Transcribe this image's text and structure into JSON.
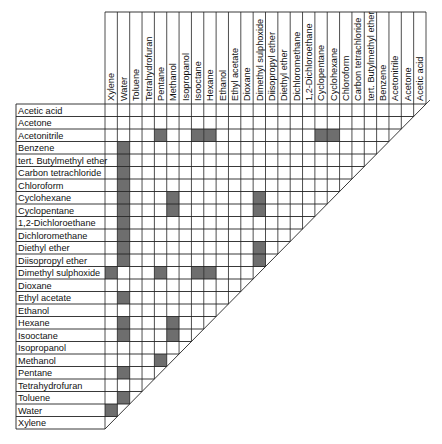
{
  "chart_data": {
    "type": "heatmap",
    "shade_color": "#6e6e6e",
    "grid_color": "#222222",
    "columns": [
      "Xylene",
      "Water",
      "Toluene",
      "Tetrahydrofuran",
      "Pentane",
      "Methanol",
      "Isopropanol",
      "Isooctane",
      "Hexane",
      "Ethanol",
      "Ethyl acetate",
      "Dioxane",
      "Dimethyl sulphoxide",
      "Diisopropyl ether",
      "Diethyl ether",
      "Dichloromethane",
      "1,2-Dichloroethane",
      "Cyclopentane",
      "Cyclohexane",
      "Chloroform",
      "Carbon tetrachloride",
      "tert. Butylmethyl ether",
      "Benzene",
      "Acetonitrile",
      "Acetone",
      "Acetic acid"
    ],
    "rows": [
      "Acetic acid",
      "Acetone",
      "Acetonitrile",
      "Benzene",
      "tert. Butylmethyl ether",
      "Carbon tetrachloride",
      "Chloroform",
      "Cyclohexane",
      "Cyclopentane",
      "1,2-Dichloroethane",
      "Dichloromethane",
      "Diethyl ether",
      "Diisopropyl ether",
      "Dimethyl sulphoxide",
      "Dioxane",
      "Ethyl acetate",
      "Ethanol",
      "Hexane",
      "Isooctane",
      "Isopropanol",
      "Methanol",
      "Pentane",
      "Tetrahydrofuran",
      "Toluene",
      "Water",
      "Xylene"
    ],
    "immiscible_pairs": [
      {
        "row": "Acetonitrile",
        "col": "Pentane"
      },
      {
        "row": "Acetonitrile",
        "col": "Isooctane"
      },
      {
        "row": "Acetonitrile",
        "col": "Hexane"
      },
      {
        "row": "Acetonitrile",
        "col": "Cyclopentane"
      },
      {
        "row": "Acetonitrile",
        "col": "Cyclohexane"
      },
      {
        "row": "Benzene",
        "col": "Water"
      },
      {
        "row": "tert. Butylmethyl ether",
        "col": "Water"
      },
      {
        "row": "Carbon tetrachloride",
        "col": "Water"
      },
      {
        "row": "Chloroform",
        "col": "Water"
      },
      {
        "row": "Cyclohexane",
        "col": "Water"
      },
      {
        "row": "Cyclohexane",
        "col": "Methanol"
      },
      {
        "row": "Cyclohexane",
        "col": "Dimethyl sulphoxide"
      },
      {
        "row": "Cyclopentane",
        "col": "Water"
      },
      {
        "row": "Cyclopentane",
        "col": "Methanol"
      },
      {
        "row": "Cyclopentane",
        "col": "Dimethyl sulphoxide"
      },
      {
        "row": "1,2-Dichloroethane",
        "col": "Water"
      },
      {
        "row": "Dichloromethane",
        "col": "Water"
      },
      {
        "row": "Diethyl ether",
        "col": "Water"
      },
      {
        "row": "Diethyl ether",
        "col": "Dimethyl sulphoxide"
      },
      {
        "row": "Diisopropyl ether",
        "col": "Water"
      },
      {
        "row": "Diisopropyl ether",
        "col": "Dimethyl sulphoxide"
      },
      {
        "row": "Dimethyl sulphoxide",
        "col": "Xylene"
      },
      {
        "row": "Dimethyl sulphoxide",
        "col": "Pentane"
      },
      {
        "row": "Dimethyl sulphoxide",
        "col": "Isooctane"
      },
      {
        "row": "Dimethyl sulphoxide",
        "col": "Hexane"
      },
      {
        "row": "Ethyl acetate",
        "col": "Water"
      },
      {
        "row": "Hexane",
        "col": "Water"
      },
      {
        "row": "Hexane",
        "col": "Methanol"
      },
      {
        "row": "Isooctane",
        "col": "Water"
      },
      {
        "row": "Isooctane",
        "col": "Methanol"
      },
      {
        "row": "Methanol",
        "col": "Pentane"
      },
      {
        "row": "Pentane",
        "col": "Water"
      },
      {
        "row": "Toluene",
        "col": "Water"
      },
      {
        "row": "Water",
        "col": "Xylene"
      }
    ],
    "shaded_cells": [
      [
        2,
        4
      ],
      [
        2,
        7
      ],
      [
        2,
        8
      ],
      [
        2,
        17
      ],
      [
        2,
        18
      ],
      [
        3,
        1
      ],
      [
        4,
        1
      ],
      [
        5,
        1
      ],
      [
        6,
        1
      ],
      [
        7,
        1
      ],
      [
        7,
        5
      ],
      [
        7,
        12
      ],
      [
        8,
        1
      ],
      [
        8,
        5
      ],
      [
        8,
        12
      ],
      [
        9,
        1
      ],
      [
        10,
        1
      ],
      [
        11,
        1
      ],
      [
        11,
        12
      ],
      [
        12,
        1
      ],
      [
        12,
        12
      ],
      [
        13,
        0
      ],
      [
        13,
        4
      ],
      [
        13,
        7
      ],
      [
        13,
        8
      ],
      [
        15,
        1
      ],
      [
        17,
        1
      ],
      [
        17,
        5
      ],
      [
        18,
        1
      ],
      [
        18,
        5
      ],
      [
        20,
        4
      ],
      [
        21,
        1
      ],
      [
        23,
        1
      ],
      [
        24,
        0
      ]
    ],
    "grid": true,
    "legend": null
  }
}
